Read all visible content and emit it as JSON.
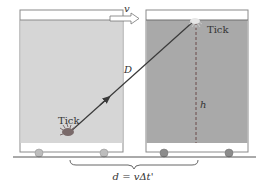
{
  "diagram": {
    "labels": {
      "velocity": "v",
      "diagonal": "D",
      "height": "h",
      "tick_start": "Tick",
      "tick_end": "Tick",
      "equation": "d = vΔt'"
    },
    "colors": {
      "left_box_fill": "#d6d6d6",
      "right_box_fill": "#a9a9a9",
      "box_band": "#ffffff",
      "box_border": "#8a8a8a",
      "wheel_left": "#bdbdbd",
      "wheel_right": "#8c8c8c",
      "light_path": "#3a3a3a",
      "ground": "#555555"
    },
    "boxes": [
      {
        "name": "clock-position-start",
        "x": 20,
        "width": 103
      },
      {
        "name": "clock-position-end",
        "x": 146,
        "width": 102
      }
    ]
  }
}
